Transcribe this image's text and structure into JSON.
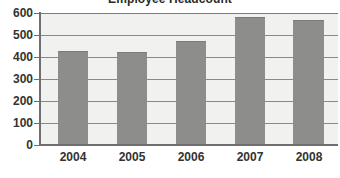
{
  "chart_data": {
    "type": "bar",
    "title": "Employee Headcount",
    "xlabel": "",
    "ylabel": "",
    "categories": [
      "2004",
      "2005",
      "2006",
      "2007",
      "2008"
    ],
    "values": [
      423,
      418,
      470,
      577,
      565
    ],
    "series": [
      {
        "name": "Employee Headcount",
        "values": [
          423,
          418,
          470,
          577,
          565
        ]
      }
    ],
    "ylim": [
      0,
      600
    ],
    "yticks": [
      0,
      100,
      200,
      300,
      400,
      500,
      600
    ],
    "ytick_labels": [
      "0",
      "100",
      "200",
      "300",
      "400",
      "500",
      "600"
    ],
    "grid": true,
    "grid_axis": "y",
    "legend": false,
    "legend_position": "none",
    "bar_color": "#8d8d8b",
    "plot_background": "#f1f1ef",
    "axis_color": "#6f6f6f",
    "gridline_color": "#8a8a85",
    "title_color": "#2a2a2a",
    "tick_label_color": "#33332f",
    "note": "Chart title is clipped by the top edge of the screenshot."
  }
}
